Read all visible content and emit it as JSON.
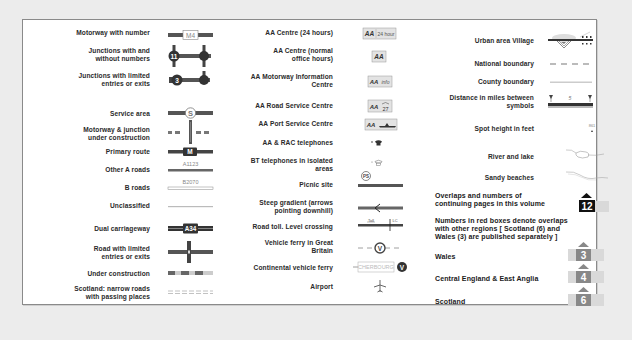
{
  "legend": {
    "columns": [
      {
        "items": [
          {
            "label": "Motorway with number",
            "symbol": "motorway",
            "road_number": "M4"
          },
          {
            "label": "Junctions with and without numbers",
            "line1": "Junctions with and",
            "line2": "without numbers",
            "symbol": "junctions",
            "junction_number": "11"
          },
          {
            "label": "Junctions with limited entries or exits",
            "line1": "Junctions with limited",
            "line2": "entries or exits",
            "symbol": "limited-junctions",
            "junction_number": "3"
          },
          {
            "label": "Service area",
            "symbol": "service-area",
            "glyph": "S"
          },
          {
            "label": "Motorway & junction under construction",
            "line1": "Motorway & junction",
            "line2": "under construction",
            "symbol": "motorway-construction"
          },
          {
            "label": "Primary route",
            "symbol": "primary-route",
            "road_number": "M"
          },
          {
            "label": "Other A roads",
            "symbol": "a-road",
            "road_number": "A1123"
          },
          {
            "label": "B roads",
            "symbol": "b-road",
            "road_number": "B2070"
          },
          {
            "label": "Unclassified",
            "symbol": "unclassified"
          },
          {
            "label": "Dual carriageway",
            "symbol": "dual-carriageway",
            "road_number": "A34"
          },
          {
            "label": "Road with limited entries or exits",
            "line1": "Road with limited",
            "line2": "entries or exits",
            "symbol": "limited-road"
          },
          {
            "label": "Under construction",
            "symbol": "under-construction"
          },
          {
            "label": "Scotland: narrow roads with passing places",
            "line1": "Scotland: narrow roads",
            "line2": "with passing places",
            "symbol": "narrow-roads"
          }
        ]
      },
      {
        "items": [
          {
            "label": "AA Centre (24 hours)",
            "symbol": "aa-24",
            "badge": "AA",
            "badge_extra": "24 hour"
          },
          {
            "label": "AA Centre (normal office hours)",
            "line1": "AA Centre (normal",
            "line2": "office hours)",
            "symbol": "aa-office",
            "badge": "AA"
          },
          {
            "label": "AA Motorway Information Centre",
            "line1": "AA  Motorway Information",
            "line2": "Centre",
            "symbol": "aa-info",
            "badge": "AA",
            "badge_extra": "info"
          },
          {
            "label": "AA Road Service Centre",
            "symbol": "aa-road-service",
            "badge": "AA",
            "badge_extra": "27"
          },
          {
            "label": "AA Port Service Centre",
            "symbol": "aa-port-service",
            "badge": "AA"
          },
          {
            "label": "AA & RAC telephones",
            "symbol": "aa-rac-phone"
          },
          {
            "label": "BT telephones in isolated areas",
            "line1": "BT telephones in isolated",
            "line2": "areas",
            "symbol": "bt-phone"
          },
          {
            "label": "Picnic site",
            "symbol": "picnic-site",
            "glyph": "PS"
          },
          {
            "label": "Steep gradient (arrows pointing downhill)",
            "line1": "Steep gradient (arrows",
            "line2": "pointing downhill)",
            "symbol": "steep-gradient"
          },
          {
            "label": "Road toll. Level crossing",
            "symbol": "toll-crossing",
            "toll_text": "Toll",
            "crossing_text": "LC"
          },
          {
            "label": "Vehicle ferry in Great Britain",
            "line1": "Vehicle ferry in Great",
            "line2": "Britain",
            "symbol": "vehicle-ferry",
            "glyph": "V"
          },
          {
            "label": "Continental vehicle ferry",
            "symbol": "continental-ferry",
            "port": "CHERBOURG",
            "glyph": "V"
          },
          {
            "label": "Airport",
            "symbol": "airport"
          }
        ]
      },
      {
        "items": [
          {
            "label": "Urban area Village",
            "symbol": "urban-village"
          },
          {
            "label": "National boundary",
            "symbol": "national-boundary"
          },
          {
            "label": "County boundary",
            "symbol": "county-boundary"
          },
          {
            "label": "Distance in miles between symbols",
            "line1": "Distance in miles between",
            "line2": "symbols",
            "symbol": "distance",
            "distance": "5"
          },
          {
            "label": "Spot height in feet",
            "symbol": "spot-height",
            "height": "861"
          },
          {
            "label": "River and lake",
            "symbol": "river-lake"
          },
          {
            "label": "Sandy beaches",
            "symbol": "sandy-beaches"
          }
        ],
        "overlaps": {
          "line1": "Overlaps and numbers of",
          "line2": "continuing pages in this volume",
          "page": "12"
        },
        "red_boxes_note": {
          "line1": "Numbers in red boxes denote  overlaps",
          "line2": "with  other regions  [ Scotland (6) and",
          "line3": "Wales (3) are published separately ]"
        },
        "regions": [
          {
            "label": "Wales",
            "page": "3"
          },
          {
            "label": "Central England & East Anglia",
            "page": "4"
          },
          {
            "label": "Scotland",
            "page": "6"
          }
        ]
      }
    ]
  },
  "colors": {
    "road_dark": "#3c3c3c",
    "motorway_fill": "#6a6a6a",
    "region_box": "#8c8c8c",
    "region_bg": "#d9d9d9",
    "panel_border": "#8a8a8a"
  }
}
